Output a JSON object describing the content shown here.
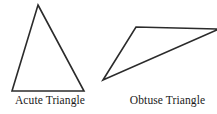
{
  "figure": {
    "width": 217,
    "height": 114,
    "background_color": "#ffffff",
    "stroke_color": "#2b2b2b",
    "label_color": "#1a1a1a"
  },
  "shapes": [
    {
      "name": "acute-triangle",
      "label": "Acute Triangle",
      "points": "38,5 84,91 12,91",
      "vertices": [
        {
          "x": 38,
          "y": 5
        },
        {
          "x": 84,
          "y": 91
        },
        {
          "x": 12,
          "y": 91
        }
      ]
    },
    {
      "name": "obtuse-triangle",
      "label": "Obtuse Triangle",
      "points": "103,80 136,27 219,29",
      "vertices": [
        {
          "x": 103,
          "y": 80
        },
        {
          "x": 136,
          "y": 27
        },
        {
          "x": 219,
          "y": 29
        }
      ]
    }
  ]
}
